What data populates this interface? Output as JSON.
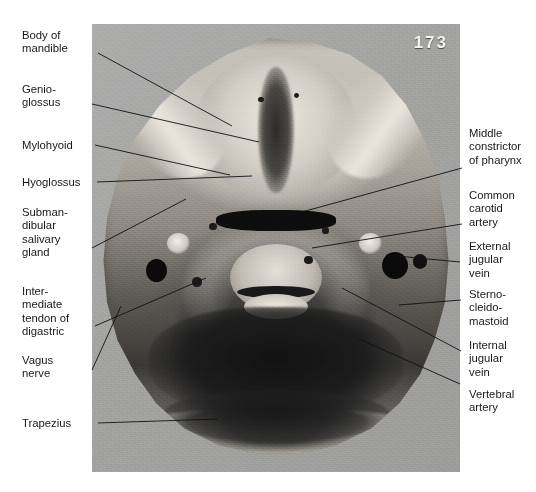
{
  "plate": {
    "page_number": "173",
    "panel_bg": "#a7a8a7",
    "text_color": "#18181c"
  },
  "labels_left": [
    {
      "id": "body-of-mandible",
      "text": "Body of\nmandible",
      "x": 22,
      "y": 29,
      "lx": 98,
      "ly": 53,
      "tx": 232,
      "ty": 126
    },
    {
      "id": "genioglossus",
      "text": "Genio-\nglossus",
      "x": 22,
      "y": 83,
      "lx": 92,
      "ly": 104,
      "tx": 259,
      "ty": 142
    },
    {
      "id": "mylohyoid",
      "text": "Mylohyoid",
      "x": 22,
      "y": 139,
      "lx": 95,
      "ly": 145,
      "tx": 230,
      "ty": 175
    },
    {
      "id": "hyoglossus",
      "text": "Hyoglossus",
      "x": 22,
      "y": 176,
      "lx": 97,
      "ly": 182,
      "tx": 252,
      "ty": 176
    },
    {
      "id": "submandibular-gland",
      "text": "Subman-\ndibular\nsalivary\ngland",
      "x": 22,
      "y": 206,
      "lx": 92,
      "ly": 248,
      "tx": 186,
      "ty": 199
    },
    {
      "id": "intermediate-tendon",
      "text": "Inter-\nmediate\ntendon of\ndigastric",
      "x": 22,
      "y": 285,
      "lx": 95,
      "ly": 326,
      "tx": 206,
      "ty": 278
    },
    {
      "id": "vagus-nerve",
      "text": "Vagus\nnerve",
      "x": 22,
      "y": 354,
      "lx": 92,
      "ly": 370,
      "tx": 121,
      "ty": 306
    },
    {
      "id": "trapezius",
      "text": "Trapezius",
      "x": 22,
      "y": 417,
      "lx": 98,
      "ly": 423,
      "tx": 218,
      "ty": 419
    }
  ],
  "labels_right": [
    {
      "id": "middle-constrictor",
      "text": "Middle\nconstrictor\nof pharynx",
      "x": 469,
      "y": 127,
      "lx": 462,
      "ly": 168,
      "tx": 269,
      "ty": 221
    },
    {
      "id": "common-carotid",
      "text": "Common\ncarotid\nartery",
      "x": 469,
      "y": 189,
      "lx": 462,
      "ly": 224,
      "tx": 312,
      "ty": 248
    },
    {
      "id": "external-jugular",
      "text": "External\njugular\nvein",
      "x": 469,
      "y": 240,
      "lx": 460,
      "ly": 262,
      "tx": 386,
      "ty": 255
    },
    {
      "id": "sternocleidomastoid",
      "text": "Sterno-\ncleido-\nmastoid",
      "x": 469,
      "y": 288,
      "lx": 461,
      "ly": 300,
      "tx": 399,
      "ty": 305
    },
    {
      "id": "internal-jugular",
      "text": "Internal\njugular\nvein",
      "x": 469,
      "y": 339,
      "lx": 461,
      "ly": 351,
      "tx": 342,
      "ty": 288
    },
    {
      "id": "vertebral-artery",
      "text": "Vertebral\nartery",
      "x": 469,
      "y": 388,
      "lx": 460,
      "ly": 384,
      "tx": 359,
      "ty": 339
    }
  ]
}
